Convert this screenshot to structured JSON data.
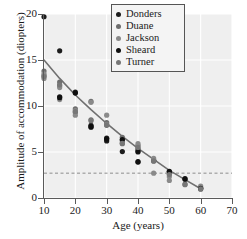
{
  "chart_data": {
    "type": "scatter",
    "title": "",
    "xlabel": "Age (years)",
    "ylabel": "Amplitude of accommodation (diopters)",
    "xlim": [
      10,
      70
    ],
    "ylim": [
      0,
      20
    ],
    "xticks": [
      10,
      20,
      30,
      40,
      50,
      60,
      70
    ],
    "yticks": [
      0,
      5,
      10,
      15,
      20
    ],
    "grid": true,
    "legend_position": "top-right",
    "legend_entries": [
      "Donders",
      "Duane",
      "Jackson",
      "Sheard",
      "Turner"
    ],
    "series": [
      {
        "name": "Donders",
        "color": "#1c1c1c",
        "points": [
          [
            10,
            19.7
          ],
          [
            15,
            16.0
          ],
          [
            15,
            11.0
          ],
          [
            20,
            11.5
          ],
          [
            25,
            7.7
          ],
          [
            25,
            7.9
          ],
          [
            30,
            6.5
          ],
          [
            30,
            6.2
          ],
          [
            35,
            6.3
          ],
          [
            35,
            5.05
          ],
          [
            40,
            5.0
          ],
          [
            40,
            3.9
          ],
          [
            45,
            4.1
          ],
          [
            50,
            2.85
          ],
          [
            55,
            2.1
          ],
          [
            60,
            1.1
          ]
        ]
      },
      {
        "name": "Duane",
        "color": "#6e6e6e",
        "points": [
          [
            10,
            13.8
          ],
          [
            10,
            13.3
          ],
          [
            15,
            12.6
          ],
          [
            15,
            12.2
          ],
          [
            20,
            9.7
          ],
          [
            20,
            9.3
          ],
          [
            25,
            10.5
          ],
          [
            25,
            8.5
          ],
          [
            30,
            8.2
          ],
          [
            30,
            7.9
          ],
          [
            35,
            6.6
          ],
          [
            35,
            5.9
          ],
          [
            40,
            5.7
          ],
          [
            40,
            5.3
          ],
          [
            45,
            4.0
          ],
          [
            50,
            2.6
          ],
          [
            55,
            1.5
          ],
          [
            60,
            0.95
          ]
        ]
      },
      {
        "name": "Jackson",
        "color": "#8a8a8a",
        "points": [
          [
            10,
            13.5
          ],
          [
            10,
            13.0
          ],
          [
            15,
            12.0
          ],
          [
            15,
            10.7
          ],
          [
            20,
            9.5
          ],
          [
            20,
            9.0
          ],
          [
            25,
            10.4
          ],
          [
            30,
            9.0
          ],
          [
            30,
            8.0
          ],
          [
            35,
            6.1
          ],
          [
            40,
            5.9
          ],
          [
            40,
            5.4
          ],
          [
            45,
            4.3
          ],
          [
            45,
            2.7
          ],
          [
            50,
            2.3
          ],
          [
            50,
            1.9
          ],
          [
            60,
            1.3
          ]
        ]
      },
      {
        "name": "Sheard",
        "color": "#101010",
        "points": [
          [
            15,
            10.9
          ],
          [
            20,
            11.4
          ],
          [
            25,
            7.75
          ],
          [
            30,
            6.4
          ],
          [
            35,
            6.35
          ],
          [
            40,
            5.1
          ],
          [
            40,
            3.95
          ],
          [
            50,
            2.9
          ],
          [
            55,
            2.05
          ],
          [
            60,
            1.05
          ]
        ]
      },
      {
        "name": "Turner",
        "color": "#777777",
        "points": [
          [
            10,
            13.2
          ],
          [
            15,
            12.3
          ],
          [
            20,
            9.4
          ],
          [
            25,
            8.4
          ],
          [
            30,
            7.95
          ],
          [
            35,
            5.95
          ],
          [
            40,
            5.5
          ],
          [
            45,
            4.05
          ],
          [
            50,
            2.55
          ],
          [
            55,
            1.45
          ],
          [
            60,
            1.0
          ]
        ]
      }
    ],
    "fit_curve": {
      "name": "regression-curve",
      "color": "#707070",
      "points": [
        [
          10,
          15.0
        ],
        [
          15,
          13.0
        ],
        [
          20,
          11.2
        ],
        [
          25,
          9.6
        ],
        [
          30,
          8.1
        ],
        [
          35,
          6.7
        ],
        [
          40,
          5.4
        ],
        [
          45,
          4.2
        ],
        [
          50,
          3.0
        ],
        [
          55,
          2.0
        ],
        [
          60,
          1.0
        ]
      ]
    },
    "reference_line": {
      "name": "threshold-line",
      "orientation": "horizontal",
      "value": 2.7,
      "style": "dashed",
      "color": "#8c8c8c"
    }
  }
}
